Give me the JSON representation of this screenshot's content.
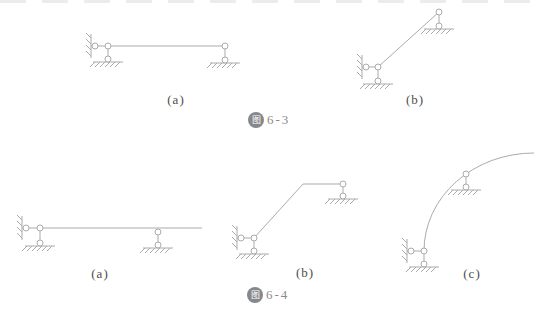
{
  "colors": {
    "line": "#ababab",
    "label": "#4d4d4d",
    "badge_bg": "#86888b",
    "caption_text": "#8a8a8a"
  },
  "figure_6_3": {
    "caption_badge": "图",
    "caption_number": "6-3",
    "subfigures": [
      {
        "label": "(a)"
      },
      {
        "label": "(b)"
      }
    ]
  },
  "figure_6_4": {
    "caption_badge": "图",
    "caption_number": "6-4",
    "subfigures": [
      {
        "label": "(a)"
      },
      {
        "label": "(b)"
      },
      {
        "label": "(c)"
      }
    ]
  }
}
